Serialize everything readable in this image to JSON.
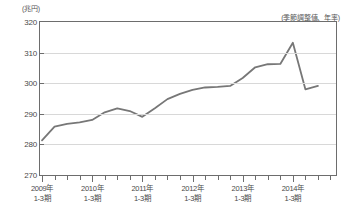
{
  "chart_data": {
    "type": "line",
    "title": "",
    "unit_label": "(兆円)",
    "note": "(季節調整値、年率)",
    "xlabel": "",
    "ylabel": "兆円",
    "ylim": [
      270,
      320
    ],
    "yticks": [
      270,
      280,
      290,
      300,
      310,
      320
    ],
    "grid": true,
    "legend": "none",
    "x_major_labels": [
      {
        "line1": "2009年",
        "line2": "1-3期",
        "index": 0
      },
      {
        "line1": "2010年",
        "line2": "1-3期",
        "index": 4
      },
      {
        "line1": "2011年",
        "line2": "1-3期",
        "index": 8
      },
      {
        "line1": "2012年",
        "line2": "1-3期",
        "index": 12
      },
      {
        "line1": "2013年",
        "line2": "1-3期",
        "index": 16
      },
      {
        "line1": "2014年",
        "line2": "1-3期",
        "index": 20
      }
    ],
    "x": [
      "2009 1-3",
      "2009 4-6",
      "2009 7-9",
      "2009 10-12",
      "2010 1-3",
      "2010 4-6",
      "2010 7-9",
      "2010 10-12",
      "2011 1-3",
      "2011 4-6",
      "2011 7-9",
      "2011 10-12",
      "2012 1-3",
      "2012 4-6",
      "2012 7-9",
      "2012 10-12",
      "2013 1-3",
      "2013 4-6",
      "2013 7-9",
      "2013 10-12",
      "2014 1-3",
      "2014 4-6",
      "2014 7-9"
    ],
    "values": [
      281.3,
      285.8,
      286.7,
      287.2,
      288.0,
      290.5,
      291.8,
      290.9,
      289.0,
      291.8,
      294.8,
      296.5,
      297.8,
      298.6,
      298.8,
      299.1,
      301.7,
      305.2,
      306.2,
      306.3,
      313.2,
      298.0,
      299.1
    ],
    "series_color": "#777777",
    "axis_color": "#6d6d6d",
    "grid_color": "#d8d8d8"
  }
}
